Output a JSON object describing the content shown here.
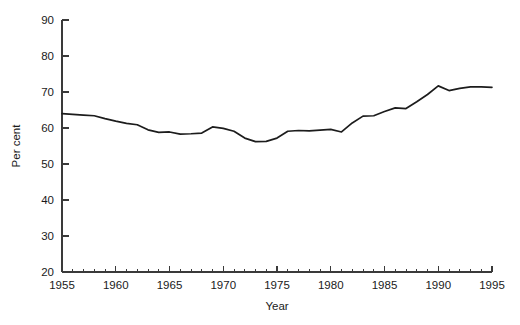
{
  "chart_data": {
    "type": "line",
    "title": "",
    "xlabel": "Year",
    "ylabel": "Per cent",
    "xlim": [
      1955,
      1995
    ],
    "ylim": [
      20,
      90
    ],
    "grid": false,
    "legend": false,
    "x_tick_labels": [
      "1955",
      "1960",
      "1965",
      "1970",
      "1975",
      "1980",
      "1985",
      "1990",
      "1995"
    ],
    "x_tick_values": [
      1955,
      1960,
      1965,
      1970,
      1975,
      1980,
      1985,
      1990,
      1995
    ],
    "x_minor_tick_interval": 1,
    "y_tick_labels": [
      "20",
      "30",
      "40",
      "50",
      "60",
      "70",
      "80",
      "90"
    ],
    "y_tick_values": [
      20,
      30,
      40,
      50,
      60,
      70,
      80,
      90
    ],
    "series": [
      {
        "name": "Per cent",
        "color": "#1c1c1c",
        "x": [
          1955,
          1956,
          1957,
          1958,
          1959,
          1960,
          1961,
          1962,
          1963,
          1964,
          1965,
          1966,
          1967,
          1968,
          1969,
          1970,
          1971,
          1972,
          1973,
          1974,
          1975,
          1976,
          1977,
          1978,
          1979,
          1980,
          1981,
          1982,
          1983,
          1984,
          1985,
          1986,
          1987,
          1988,
          1989,
          1990,
          1991,
          1992,
          1993,
          1994,
          1995
        ],
        "values": [
          64.0,
          63.8,
          63.6,
          63.4,
          62.6,
          61.9,
          61.3,
          60.9,
          59.5,
          58.8,
          58.9,
          58.3,
          58.4,
          58.6,
          60.3,
          59.9,
          59.1,
          57.2,
          56.2,
          56.3,
          57.2,
          59.1,
          59.3,
          59.2,
          59.4,
          59.6,
          58.9,
          61.4,
          63.3,
          63.4,
          64.6,
          65.6,
          65.4,
          67.3,
          69.3,
          71.7,
          70.4,
          71.0,
          71.4,
          71.4,
          71.3
        ]
      }
    ]
  },
  "axes": {
    "y_title": "Per cent",
    "x_title": "Year"
  }
}
